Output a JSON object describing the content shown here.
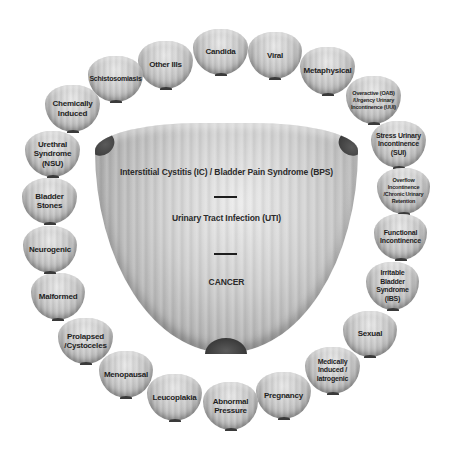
{
  "diagram": {
    "center": {
      "shape": "bladder",
      "items": [
        {
          "label": "Interstitial Cystitis (IC) / Bladder Pain Syndrome (BPS)"
        },
        {
          "label": "Urinary Tract Infection (UTI)"
        },
        {
          "label": "CANCER"
        }
      ]
    },
    "ring": [
      {
        "label": "Other Ills"
      },
      {
        "label": "Candida"
      },
      {
        "label": "Viral"
      },
      {
        "label": "Metaphysical"
      },
      {
        "label": "Overactive (OAB) /Urgency Urinary Incontinence (UUI)"
      },
      {
        "label": "Stress Urinary Incontinence (SUI)"
      },
      {
        "label": "Overflow Incontinence /Chronic Urinary Retention"
      },
      {
        "label": "Functional Incontinence"
      },
      {
        "label": "Irritable Bladder Syndrome (IBS)"
      },
      {
        "label": "Sexual"
      },
      {
        "label": "Medically Induced / Iatrogenic"
      },
      {
        "label": "Pregnancy"
      },
      {
        "label": "Abnormal Pressure"
      },
      {
        "label": "Leucoplakia"
      },
      {
        "label": "Menopausal"
      },
      {
        "label": "Prolapsed /Cystoceles"
      },
      {
        "label": "Malformed"
      },
      {
        "label": "Neurogenic"
      },
      {
        "label": "Bladder Stones"
      },
      {
        "label": "Urethral Syndrome (NSU)"
      },
      {
        "label": "Chemically Induced"
      },
      {
        "label": "Schistosomiasis"
      }
    ],
    "colors": {
      "bubble": "#c8c8c8",
      "text": "#1e1e1e",
      "background": "#ffffff"
    }
  }
}
